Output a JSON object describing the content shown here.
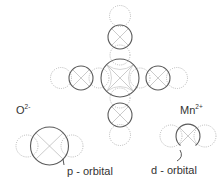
{
  "diagram": {
    "type": "orbital-overlap-schematic",
    "labels": {
      "oxygen_ion": {
        "base": "O",
        "charge": "2-"
      },
      "manganese_ion": {
        "base": "Mn",
        "charge": "2+"
      },
      "p_orbital": "p - orbital",
      "d_orbital": "d - orbital"
    },
    "colors": {
      "solid_circle": "#5a5a5a",
      "dotted_circle": "#b0b0b0",
      "cross": "#b5b5b5",
      "text": "#333333"
    },
    "cluster": {
      "center_ion": "Mn2+",
      "center": {
        "x": 120,
        "y": 78,
        "r": 19
      },
      "ligands": [
        {
          "position": "top",
          "x": 120,
          "y": 37,
          "r": 12
        },
        {
          "position": "left",
          "x": 81,
          "y": 78,
          "r": 12
        },
        {
          "position": "right",
          "x": 158,
          "y": 78,
          "r": 12
        },
        {
          "position": "bottom",
          "x": 120,
          "y": 115,
          "r": 12
        }
      ]
    },
    "legend_items": [
      {
        "ion": "O2-",
        "orbital": "p - orbital"
      },
      {
        "ion": "Mn2+",
        "orbital": "d - orbital"
      }
    ]
  }
}
